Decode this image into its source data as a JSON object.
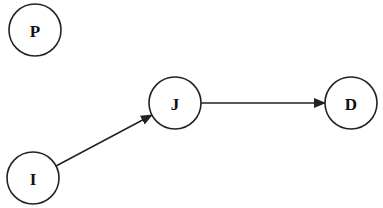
{
  "diagram": {
    "type": "directed-graph",
    "nodes": [
      {
        "id": "P",
        "label": "P",
        "cx": 35,
        "cy": 30,
        "r": 26
      },
      {
        "id": "J",
        "label": "J",
        "cx": 175,
        "cy": 103,
        "r": 26
      },
      {
        "id": "D",
        "label": "D",
        "cx": 351,
        "cy": 103,
        "r": 26
      },
      {
        "id": "I",
        "label": "I",
        "cx": 33,
        "cy": 178,
        "r": 26
      }
    ],
    "edges": [
      {
        "from": "I",
        "to": "J",
        "directed": true
      },
      {
        "from": "J",
        "to": "D",
        "directed": true
      }
    ],
    "colors": {
      "stroke": "#222222",
      "background": "#ffffff"
    }
  }
}
